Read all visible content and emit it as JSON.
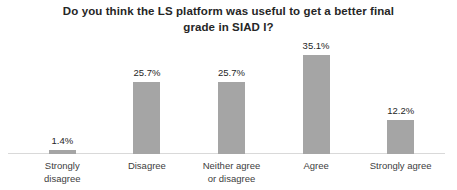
{
  "chart_data": {
    "type": "bar",
    "title": "Do you think the LS platform was useful to get a better final grade in SIAD I?",
    "categories": [
      "Strongly disagree",
      "Disagree",
      "Neither agree or disagree",
      "Agree",
      "Strongly agree"
    ],
    "values": [
      1.4,
      25.7,
      25.7,
      35.1,
      12.2
    ],
    "data_labels": [
      "1.4%",
      "25.7%",
      "25.7%",
      "35.1%",
      "12.2%"
    ],
    "unit": "%",
    "xlabel": "",
    "ylabel": "",
    "ylim": [
      0,
      40
    ],
    "grid": false,
    "legend": false,
    "y_axis_visible": false,
    "colors": {
      "bar": "#a5a5a5",
      "title_text": "#262626",
      "data_label_text": "#262626",
      "category_label_text": "#404040",
      "axis_line": "#d9d9d9",
      "background": "#ffffff"
    }
  }
}
